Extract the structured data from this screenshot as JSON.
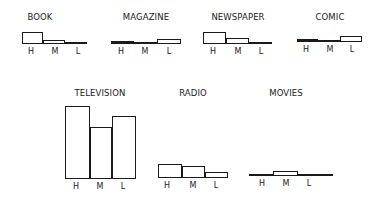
{
  "chart_data": [
    {
      "type": "bar",
      "title": "BOOK",
      "categories": [
        "H",
        "M",
        "L"
      ],
      "values": [
        11,
        3,
        0
      ],
      "unit": "px-height (relative)"
    },
    {
      "type": "bar",
      "title": "MAGAZINE",
      "categories": [
        "H",
        "M",
        "L"
      ],
      "values": [
        1.5,
        0,
        4
      ]
    },
    {
      "type": "bar",
      "title": "NEWSPAPER",
      "categories": [
        "H",
        "M",
        "L"
      ],
      "values": [
        11,
        5,
        0
      ]
    },
    {
      "type": "bar",
      "title": "COMIC",
      "categories": [
        "H",
        "M",
        "L"
      ],
      "values": [
        2,
        0,
        5
      ]
    },
    {
      "type": "bar",
      "title": "TELEVISION",
      "categories": [
        "H",
        "M",
        "L"
      ],
      "values": [
        72,
        51,
        62
      ]
    },
    {
      "type": "bar",
      "title": "RADIO",
      "categories": [
        "H",
        "M",
        "L"
      ],
      "values": [
        13,
        11,
        5
      ]
    },
    {
      "type": "bar",
      "title": "MOVIES",
      "categories": [
        "H",
        "M",
        "L"
      ],
      "values": [
        0,
        4,
        0
      ]
    }
  ],
  "panels": [
    {
      "title": "BOOK",
      "title_x": 40,
      "title_y": 12,
      "base_y": 43,
      "line_x0": 22,
      "line_x1": 87,
      "bars": [
        {
          "x": 22,
          "w": 21,
          "h": 11,
          "filled": false
        },
        {
          "x": 43,
          "w": 22,
          "h": 3,
          "filled": false
        },
        {
          "x": 65,
          "w": 22,
          "h": 0,
          "filled": false
        }
      ],
      "ticks": [
        {
          "label": "H",
          "x": 31
        },
        {
          "label": "M",
          "x": 55
        },
        {
          "label": "L",
          "x": 78
        }
      ]
    },
    {
      "title": "MAGAZINE",
      "title_x": 146,
      "title_y": 12,
      "base_y": 43,
      "line_x0": 111,
      "line_x1": 181,
      "bars": [
        {
          "x": 111,
          "w": 23,
          "h": 2,
          "filled": true
        },
        {
          "x": 134,
          "w": 23,
          "h": 0,
          "filled": false
        },
        {
          "x": 157,
          "w": 24,
          "h": 4,
          "filled": false
        }
      ],
      "ticks": [
        {
          "label": "H",
          "x": 121
        },
        {
          "label": "M",
          "x": 145
        },
        {
          "label": "L",
          "x": 169
        }
      ]
    },
    {
      "title": "NEWSPAPER",
      "title_x": 238,
      "title_y": 12,
      "base_y": 43,
      "line_x0": 203,
      "line_x1": 272,
      "bars": [
        {
          "x": 203,
          "w": 23,
          "h": 11,
          "filled": false
        },
        {
          "x": 226,
          "w": 23,
          "h": 5,
          "filled": false
        },
        {
          "x": 249,
          "w": 23,
          "h": 0,
          "filled": false
        }
      ],
      "ticks": [
        {
          "label": "H",
          "x": 213
        },
        {
          "label": "M",
          "x": 238
        },
        {
          "label": "L",
          "x": 261
        }
      ]
    },
    {
      "title": "COMIC",
      "title_x": 330,
      "title_y": 12,
      "base_y": 41,
      "line_x0": 297,
      "line_x1": 362,
      "bars": [
        {
          "x": 297,
          "w": 21,
          "h": 2,
          "filled": true
        },
        {
          "x": 318,
          "w": 22,
          "h": 0,
          "filled": false
        },
        {
          "x": 340,
          "w": 22,
          "h": 5,
          "filled": false
        }
      ],
      "ticks": [
        {
          "label": "H",
          "x": 306
        },
        {
          "label": "M",
          "x": 330
        },
        {
          "label": "L",
          "x": 352
        }
      ]
    },
    {
      "title": "TELEVISION",
      "title_x": 100,
      "title_y": 88,
      "base_y": 178,
      "line_x0": 65,
      "line_x1": 136,
      "bars": [
        {
          "x": 65,
          "w": 25,
          "h": 72,
          "filled": false
        },
        {
          "x": 90,
          "w": 22,
          "h": 51,
          "filled": false
        },
        {
          "x": 112,
          "w": 24,
          "h": 62,
          "filled": false
        }
      ],
      "ticks": [
        {
          "label": "H",
          "x": 76
        },
        {
          "label": "M",
          "x": 100
        },
        {
          "label": "L",
          "x": 123
        }
      ]
    },
    {
      "title": "RADIO",
      "title_x": 193,
      "title_y": 88,
      "base_y": 177,
      "line_x0": 158,
      "line_x1": 228,
      "bars": [
        {
          "x": 158,
          "w": 24,
          "h": 13,
          "filled": false
        },
        {
          "x": 182,
          "w": 23,
          "h": 11,
          "filled": false
        },
        {
          "x": 205,
          "w": 23,
          "h": 5,
          "filled": false
        }
      ],
      "ticks": [
        {
          "label": "H",
          "x": 167
        },
        {
          "label": "M",
          "x": 193
        },
        {
          "label": "L",
          "x": 216
        }
      ]
    },
    {
      "title": "MOVIES",
      "title_x": 286,
      "title_y": 88,
      "base_y": 175,
      "line_x0": 249,
      "line_x1": 333,
      "bars": [
        {
          "x": 249,
          "w": 24,
          "h": 0,
          "filled": false
        },
        {
          "x": 273,
          "w": 25,
          "h": 4,
          "filled": false
        },
        {
          "x": 298,
          "w": 25,
          "h": 0,
          "filled": false
        }
      ],
      "ticks": [
        {
          "label": "H",
          "x": 262
        },
        {
          "label": "M",
          "x": 286
        },
        {
          "label": "L",
          "x": 309
        }
      ]
    }
  ]
}
